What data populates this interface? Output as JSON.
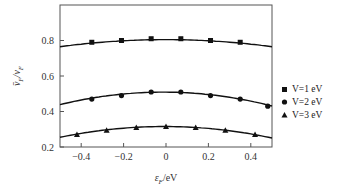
{
  "chart_data": {
    "type": "line",
    "title": "",
    "xlabel": "ε_F/eV",
    "ylabel": "v̄_F/v_F",
    "xlim": [
      -0.5,
      0.5
    ],
    "ylim": [
      0.2,
      1.0
    ],
    "xticks": [
      -0.4,
      -0.2,
      0,
      0.2,
      0.4
    ],
    "xtick_labels": [
      "−0.4",
      "−0.2",
      "0",
      "0.2",
      "0.4"
    ],
    "yticks": [
      0.2,
      0.4,
      0.6,
      0.8
    ],
    "ytick_labels": [
      "0.2",
      "0.4",
      "0.6",
      "0.8"
    ],
    "grid": false,
    "legend_position": "right-outside",
    "series": [
      {
        "name": "V=1 eV",
        "marker": "square",
        "x": [
          -0.35,
          -0.21,
          -0.07,
          0.07,
          0.21,
          0.35
        ],
        "y": [
          0.79,
          0.8,
          0.81,
          0.81,
          0.8,
          0.79
        ],
        "curve_x": [
          -0.5,
          -0.25,
          0,
          0.25,
          0.5
        ],
        "curve_y": [
          0.765,
          0.795,
          0.805,
          0.795,
          0.765
        ]
      },
      {
        "name": "V=2 eV",
        "marker": "circle",
        "x": [
          -0.35,
          -0.21,
          -0.07,
          0.07,
          0.21,
          0.35,
          0.48
        ],
        "y": [
          0.47,
          0.49,
          0.51,
          0.51,
          0.49,
          0.47,
          0.43
        ],
        "curve_x": [
          -0.5,
          -0.25,
          0,
          0.25,
          0.5
        ],
        "curve_y": [
          0.44,
          0.49,
          0.51,
          0.49,
          0.43
        ]
      },
      {
        "name": "V=3 eV",
        "marker": "triangle",
        "x": [
          -0.42,
          -0.28,
          -0.14,
          0.0,
          0.14,
          0.28,
          0.42
        ],
        "y": [
          0.27,
          0.295,
          0.31,
          0.315,
          0.31,
          0.295,
          0.27
        ],
        "curve_x": [
          -0.5,
          -0.25,
          0,
          0.25,
          0.5
        ],
        "curve_y": [
          0.255,
          0.3,
          0.315,
          0.3,
          0.25
        ]
      }
    ]
  },
  "legend": {
    "items": [
      {
        "label": "V=1 eV",
        "marker": "square"
      },
      {
        "label": "V=2 eV",
        "marker": "circle"
      },
      {
        "label": "V=3 eV",
        "marker": "triangle"
      }
    ]
  },
  "axes": {
    "xlabel_main": "ε",
    "xlabel_sub": "F",
    "xlabel_rest": "/eV",
    "ylabel_main": "v̄",
    "ylabel_sub": "F",
    "ylabel_mid": "/v",
    "ylabel_sub2": "F"
  }
}
